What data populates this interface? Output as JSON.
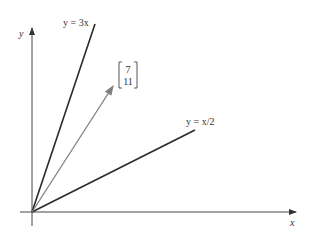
{
  "diagram": {
    "axes": {
      "x_label": "x",
      "y_label": "y",
      "color": "#333333"
    },
    "lines": [
      {
        "label": "y = 3x",
        "slope": 3,
        "color": "#2a2a2a"
      },
      {
        "label": "y = x/2",
        "slope": 0.5,
        "color": "#2a2a2a"
      }
    ],
    "vector": {
      "components": [
        "7",
        "11"
      ],
      "color": "#808080"
    }
  }
}
